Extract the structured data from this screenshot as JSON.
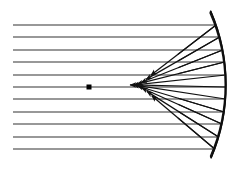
{
  "figure": {
    "title": "Spherical aberration of a concave spherical mirror",
    "canvas": {
      "width": 236,
      "height": 169,
      "background": "#ffffff"
    },
    "stroke_color": "#111111",
    "mirror_fill": "#d8d8d8",
    "hatch_color": "#1a1a1a"
  },
  "chart_data": {
    "type": "diagram",
    "title": "Spherical aberration of a concave spherical mirror",
    "xlabel": "",
    "ylabel": "",
    "mirror": {
      "shape": "circular-arc",
      "center_x": 40,
      "center_y": 85,
      "radius": 186,
      "thickness": 7,
      "top_end": {
        "x": 201,
        "y": 11
      },
      "vertex": {
        "x": 226,
        "y": 85
      },
      "bottom_end": {
        "x": 201,
        "y": 158
      },
      "hatched": true
    },
    "optical_axis_y": 87,
    "focus_marker": {
      "x": 89,
      "y": 87,
      "size": 5,
      "shape": "square"
    },
    "incoming_rays": {
      "count": 11,
      "x_start": 13,
      "direction": "left-to-right",
      "y_values": [
        25,
        37,
        50,
        62,
        75,
        87,
        99,
        112,
        124,
        137,
        149
      ]
    },
    "reflected_rays": {
      "count": 11,
      "arrowheads": "solid-triangle",
      "direction": "back-to-left",
      "forms_caustic": true
    }
  }
}
